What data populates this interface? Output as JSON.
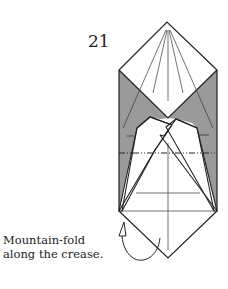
{
  "step": {
    "number": "21"
  },
  "caption": {
    "line1": "Mountain-fold",
    "line2": "along the crease."
  },
  "colors": {
    "paper_back": "#9a9a9a",
    "paper_front": "#ffffff",
    "line": "#222222"
  }
}
